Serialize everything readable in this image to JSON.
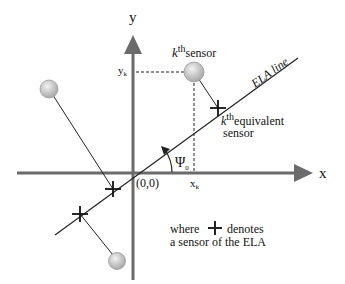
{
  "axes": {
    "x_label": "x",
    "y_label": "y",
    "origin_label": "(0,0)",
    "xk_label": "x",
    "xk_sub": "k",
    "yk_label": "y",
    "yk_sub": "k",
    "color": "#6b6b6b"
  },
  "ela": {
    "line_label": "ELA line",
    "angle_label": "Ψ",
    "angle_sub": "0"
  },
  "sensor": {
    "k": "k",
    "th": "th",
    "sensor_word": "sensor",
    "equivalent_word": "equivalent",
    "equivalent_line2": "sensor",
    "fill_color": "#c8c8c8"
  },
  "legend": {
    "where": "where",
    "denotes": "denotes",
    "line2": "a sensor of the ELA"
  }
}
